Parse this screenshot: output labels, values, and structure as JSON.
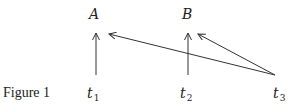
{
  "caption": "Figure 1",
  "nodes": [
    {
      "id": "A",
      "label": "A"
    },
    {
      "id": "B",
      "label": "B"
    }
  ],
  "time_points": [
    {
      "id": "t1",
      "base": "t",
      "sub": "1"
    },
    {
      "id": "t2",
      "base": "t",
      "sub": "2"
    },
    {
      "id": "t3",
      "base": "t",
      "sub": "3"
    }
  ],
  "edges": [
    {
      "from": "t1",
      "to": "A"
    },
    {
      "from": "t2",
      "to": "B"
    },
    {
      "from": "t3",
      "to": "A"
    },
    {
      "from": "t3",
      "to": "B"
    }
  ],
  "colors": {
    "stroke": "#333333",
    "text": "#222222",
    "background": "#ffffff"
  }
}
